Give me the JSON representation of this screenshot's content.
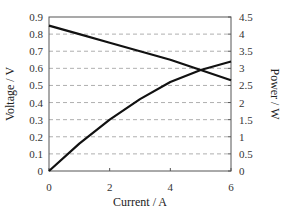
{
  "chart_data": {
    "type": "line",
    "title": "",
    "xlabel": "Current / A",
    "ylabel": "Voltage / V",
    "y2label": "Power / W",
    "xlim": [
      0,
      6
    ],
    "ylim": [
      0,
      0.9
    ],
    "y2lim": [
      0,
      4.5
    ],
    "xticks": [
      "0",
      "2",
      "4",
      "6"
    ],
    "yticks": [
      "0",
      "0.1",
      "0.2",
      "0.3",
      "0.4",
      "0.5",
      "0.6",
      "0.7",
      "0.8",
      "0.9"
    ],
    "y2ticks": [
      "0",
      "0.5",
      "1",
      "1.5",
      "2",
      "2.5",
      "3",
      "3.5",
      "4",
      "4.5"
    ],
    "grid": "horizontal dashed",
    "legend": "none",
    "series": [
      {
        "name": "Voltage",
        "axis": "left",
        "x": [
          0,
          1,
          2,
          3,
          4,
          5,
          6
        ],
        "values": [
          0.85,
          0.8,
          0.75,
          0.7,
          0.65,
          0.59,
          0.53
        ]
      },
      {
        "name": "Power",
        "axis": "right",
        "x": [
          0,
          1,
          2,
          3,
          4,
          5,
          6
        ],
        "values": [
          0,
          0.8,
          1.5,
          2.1,
          2.6,
          2.95,
          3.2
        ]
      }
    ]
  }
}
